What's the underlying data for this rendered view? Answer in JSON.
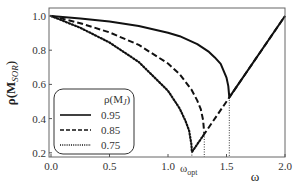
{
  "chart_data": {
    "type": "line",
    "title": "",
    "xlabel": "ω",
    "ylabel": "ρ(M_SOR)",
    "xlim": [
      0.0,
      2.0
    ],
    "ylim": [
      0.2,
      1.0
    ],
    "grid": false,
    "xticks": [
      {
        "value": 0.0,
        "label": "0.0"
      },
      {
        "value": 0.5,
        "label": "0.5"
      },
      {
        "value": 1.0,
        "label": "1.0"
      },
      {
        "value": 1.5,
        "label": "1.5"
      },
      {
        "value": 2.0,
        "label": "2.0"
      }
    ],
    "yticks": [
      {
        "value": 0.2,
        "label": "0.2"
      },
      {
        "value": 0.4,
        "label": "0.4"
      },
      {
        "value": 0.6,
        "label": "0.6"
      },
      {
        "value": 0.8,
        "label": "0.8"
      },
      {
        "value": 1.0,
        "label": "1.0"
      }
    ],
    "annotations": [
      {
        "text": "ω_opt",
        "x": 1.2,
        "position": "below x-axis"
      }
    ],
    "legend": {
      "title": "ρ(M_J)",
      "position": "lower left",
      "rounded_box": true
    },
    "series": [
      {
        "name": "0.95",
        "style": "solid",
        "omega_opt": 1.524,
        "rho_min": 0.524,
        "points": [
          [
            0.0,
            1.0
          ],
          [
            0.25,
            0.986
          ],
          [
            0.5,
            0.967
          ],
          [
            0.75,
            0.941
          ],
          [
            1.0,
            0.9025
          ],
          [
            1.1,
            0.882
          ],
          [
            1.25,
            0.835
          ],
          [
            1.35,
            0.79
          ],
          [
            1.4,
            0.758
          ],
          [
            1.45,
            0.72
          ],
          [
            1.5,
            0.64
          ],
          [
            1.515,
            0.59
          ],
          [
            1.524,
            0.524
          ],
          [
            2.0,
            1.0
          ]
        ]
      },
      {
        "name": "0.85",
        "style": "dashed",
        "omega_opt": 1.31,
        "rho_min": 0.31,
        "points": [
          [
            0.0,
            1.0
          ],
          [
            0.25,
            0.958
          ],
          [
            0.5,
            0.904
          ],
          [
            0.75,
            0.831
          ],
          [
            1.0,
            0.7225
          ],
          [
            1.1,
            0.659
          ],
          [
            1.2,
            0.57
          ],
          [
            1.25,
            0.505
          ],
          [
            1.28,
            0.455
          ],
          [
            1.3,
            0.391
          ],
          [
            1.31,
            0.31
          ],
          [
            2.0,
            1.0
          ]
        ]
      },
      {
        "name": "0.75",
        "style": "dotted",
        "omega_opt": 1.204,
        "rho_min": 0.204,
        "points": [
          [
            0.0,
            1.0
          ],
          [
            0.25,
            0.931
          ],
          [
            0.5,
            0.845
          ],
          [
            0.75,
            0.731
          ],
          [
            1.0,
            0.5625
          ],
          [
            1.1,
            0.459
          ],
          [
            1.15,
            0.386
          ],
          [
            1.18,
            0.33
          ],
          [
            1.2,
            0.25
          ],
          [
            1.204,
            0.204
          ],
          [
            1.31,
            0.31
          ]
        ]
      }
    ],
    "drop_lines": [
      {
        "x": 1.204,
        "from_y": 0.204
      },
      {
        "x": 1.31,
        "from_y": 0.31
      },
      {
        "x": 1.524,
        "from_y": 0.524
      }
    ]
  },
  "labels": {
    "xlabel": "ω",
    "ylabel_main": "ρ(M",
    "ylabel_sub": "SOR",
    "ylabel_close": ")",
    "legend_title_main": "ρ(M",
    "legend_title_sub": "J",
    "legend_title_close": ")",
    "omega_opt_main": "ω",
    "omega_opt_sub": "opt"
  }
}
